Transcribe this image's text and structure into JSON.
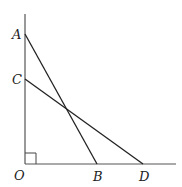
{
  "diagram": {
    "labels": {
      "A": "A",
      "B": "B",
      "C": "C",
      "D": "D",
      "O": "O"
    },
    "points": {
      "O": [
        25,
        164
      ],
      "A": [
        25,
        34
      ],
      "C": [
        25,
        79
      ],
      "B": [
        97,
        164
      ],
      "D": [
        143,
        164
      ]
    },
    "segments": [
      "AB",
      "CD"
    ],
    "axes": [
      "vertical axis through O",
      "horizontal axis through O"
    ],
    "right_angle_at": "O",
    "colors": {
      "line": "#222222",
      "axis": "#555555",
      "background": "#ffffff"
    }
  }
}
